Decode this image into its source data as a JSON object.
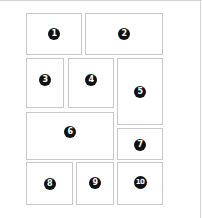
{
  "diagram": {
    "type": "layout-grid",
    "panels": [
      {
        "label": "1",
        "x": 26,
        "y": 13,
        "w": 56,
        "h": 42,
        "badge_dy": 0
      },
      {
        "label": "2",
        "x": 85,
        "y": 13,
        "w": 78,
        "h": 42,
        "badge_dy": 0
      },
      {
        "label": "3",
        "x": 26,
        "y": 58,
        "w": 38,
        "h": 50,
        "badge_dy": -3
      },
      {
        "label": "4",
        "x": 68,
        "y": 58,
        "w": 46,
        "h": 50,
        "badge_dy": -3
      },
      {
        "label": "5",
        "x": 117,
        "y": 58,
        "w": 46,
        "h": 67,
        "badge_dy": 0
      },
      {
        "label": "6",
        "x": 26,
        "y": 112,
        "w": 88,
        "h": 48,
        "badge_dy": -4
      },
      {
        "label": "7",
        "x": 117,
        "y": 128,
        "w": 46,
        "h": 32,
        "badge_dy": 1
      },
      {
        "label": "8",
        "x": 26,
        "y": 162,
        "w": 47,
        "h": 43,
        "badge_dy": 0
      },
      {
        "label": "9",
        "x": 76,
        "y": 162,
        "w": 38,
        "h": 43,
        "badge_dy": -1
      },
      {
        "label": "10",
        "x": 117,
        "y": 162,
        "w": 46,
        "h": 43,
        "badge_dy": -1
      }
    ],
    "colors": {
      "panel_border": "#c8c8c8",
      "badge_fill": "#111111",
      "badge_text": "#ffffff",
      "frame": "#d4d4d4"
    }
  }
}
